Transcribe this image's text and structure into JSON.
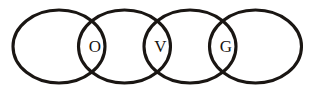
{
  "diagram": {
    "kind": "overlapping-circles-chain",
    "background_color": "#ffffff",
    "stroke_color": "#1a1613",
    "stroke_width": 3.1,
    "label_color": "#171310",
    "canvas": {
      "width": 325,
      "height": 93
    },
    "circles": [
      {
        "id": "circle-1",
        "cx": 59,
        "cy": 46.5,
        "rx": 46,
        "ry": 36.5
      },
      {
        "id": "circle-2",
        "cx": 124.5,
        "cy": 46.5,
        "rx": 46,
        "ry": 36.5
      },
      {
        "id": "circle-3",
        "cx": 190,
        "cy": 46.5,
        "rx": 46,
        "ry": 36.5
      },
      {
        "id": "circle-4",
        "cx": 255.5,
        "cy": 46.5,
        "rx": 46,
        "ry": 36.5
      }
    ],
    "intersections": [
      {
        "id": "intersection-1",
        "label": "O",
        "between": [
          "circle-1",
          "circle-2"
        ],
        "x": 95,
        "y": 48
      },
      {
        "id": "intersection-2",
        "label": "V",
        "between": [
          "circle-2",
          "circle-3"
        ],
        "x": 160.5,
        "y": 48
      },
      {
        "id": "intersection-3",
        "label": "G",
        "between": [
          "circle-3",
          "circle-4"
        ],
        "x": 226,
        "y": 48
      }
    ],
    "crossing_points_x": [
      92,
      158,
      223
    ],
    "crossing_points_y": [
      22,
      72
    ]
  }
}
